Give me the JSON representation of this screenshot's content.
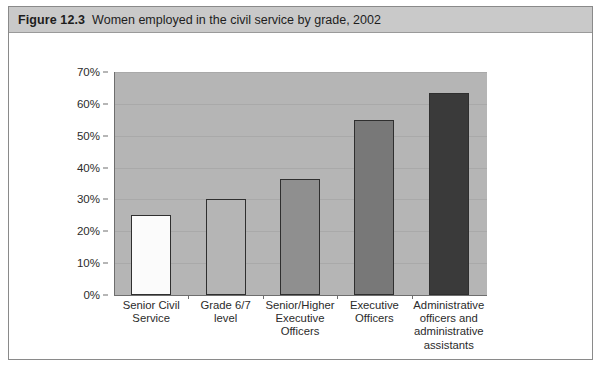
{
  "figure": {
    "label": "Figure 12.3",
    "caption": "Women employed in the civil service by grade, 2002"
  },
  "chart_data": {
    "type": "bar",
    "title": "Women employed in the civil service by grade, 2002",
    "xlabel": "",
    "ylabel": "",
    "ylim": [
      0,
      70
    ],
    "grid": true,
    "legend": "none",
    "categories": [
      "Senior Civil Service",
      "Grade 6/7 level",
      "Senior/Higher Executive Officers",
      "Executive Officers",
      "Administrative officers and administrative assistants"
    ],
    "category_lines": [
      [
        "Senior Civil",
        "Service"
      ],
      [
        "Grade 6/7 level"
      ],
      [
        "Senior/Higher",
        "Executive",
        "Officers"
      ],
      [
        "Executive",
        "Officers"
      ],
      [
        "Administrative",
        "officers and",
        "administrative",
        "assistants"
      ]
    ],
    "values": [
      25,
      30,
      36.5,
      55,
      63.5
    ],
    "value_labels": [
      "25%",
      "30%",
      "36.5%",
      "55%",
      "63.5%"
    ],
    "bar_colors": [
      "#fbfbfb",
      "#b5b5b5",
      "#8f8f8f",
      "#787878",
      "#3a3a3a"
    ],
    "bar_border_color": "#2f2f2f",
    "yticks": [
      0,
      10,
      20,
      30,
      40,
      50,
      60,
      70
    ],
    "ytick_labels": [
      "0%",
      "10%",
      "20%",
      "30%",
      "40%",
      "50%",
      "60%",
      "70%"
    ],
    "plot_background": "#b5b5b5",
    "gridline_color": "#a9a9a9",
    "axis_color": "#6e6e6e"
  }
}
